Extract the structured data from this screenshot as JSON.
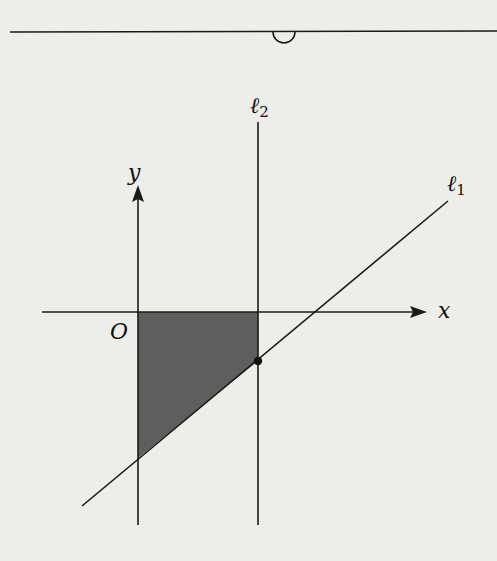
{
  "diagram": {
    "type": "coordinate-geometry",
    "labels": {
      "y_axis": "y",
      "x_axis": "x",
      "origin": "O",
      "line1_base": "ℓ",
      "line1_sub": "1",
      "line2_base": "ℓ",
      "line2_sub": "2"
    },
    "colors": {
      "background": "#ededea",
      "stroke": "#1a1a1a",
      "shade": "#5e5e5e",
      "point": "#111111"
    },
    "geometry": {
      "origin_px": [
        138,
        312
      ],
      "x_axis": {
        "x1": 42,
        "x2": 425,
        "y": 312
      },
      "y_axis": {
        "x": 138,
        "y1": 525,
        "y2": 186
      },
      "l2": {
        "x": 258,
        "y1": 125,
        "y2": 525
      },
      "l1": {
        "x1": 82,
        "y1": 505,
        "x2": 448,
        "y2": 201
      },
      "point": [
        258,
        361
      ],
      "shaded_polygon": [
        [
          138,
          312
        ],
        [
          258,
          312
        ],
        [
          258,
          361
        ],
        [
          138,
          458
        ]
      ],
      "top_rule": {
        "x1": 10,
        "x2": 497,
        "y": 32
      },
      "top_semicircle": {
        "cx": 284,
        "cy": 32,
        "r": 11
      }
    }
  }
}
